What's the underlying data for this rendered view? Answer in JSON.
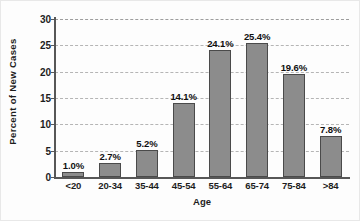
{
  "chart_data": {
    "type": "bar",
    "title": "",
    "xlabel": "Age",
    "ylabel": "Percent of New Cases",
    "categories": [
      "<20",
      "20-34",
      "35-44",
      "45-54",
      "55-64",
      "65-74",
      "75-84",
      ">84"
    ],
    "values": [
      1.0,
      2.7,
      5.2,
      14.1,
      24.1,
      25.4,
      19.6,
      7.8
    ],
    "data_labels": [
      "1.0%",
      "2.7%",
      "5.2%",
      "14.1%",
      "24.1%",
      "25.4%",
      "19.6%",
      "7.8%"
    ],
    "ylim": [
      0,
      30
    ],
    "yticks": [
      0,
      5,
      10,
      15,
      20,
      25,
      30
    ],
    "ytick_labels": [
      "0",
      "5",
      "10",
      "15",
      "20",
      "25",
      "30"
    ],
    "grid": true,
    "grid_axis": "y",
    "grid_style": "dashed",
    "legend": null,
    "legend_position": "none",
    "colors": {
      "bar_fill": "#8c8c8c",
      "bar_stroke": "#4a4a4a",
      "gridline": "#a9a9a9",
      "axis": "#575757",
      "text": "#1d1d1d",
      "background": "#fdfdfd"
    }
  }
}
